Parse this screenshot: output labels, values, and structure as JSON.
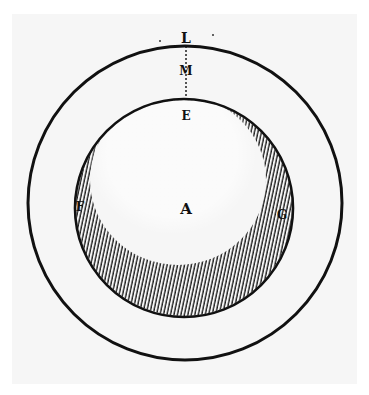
{
  "diagram": {
    "colors": {
      "ink": "#111111",
      "paper": "#f6f6f6",
      "background": "#ffffff"
    },
    "labels": {
      "L": "L",
      "M": "M",
      "E": "E",
      "F": "F",
      "A": "A",
      "G": "G"
    },
    "outer_circle": {
      "cx": 185,
      "cy": 203,
      "r": 157
    },
    "inner_sphere": {
      "cx": 184,
      "cy": 208,
      "r": 109
    }
  }
}
